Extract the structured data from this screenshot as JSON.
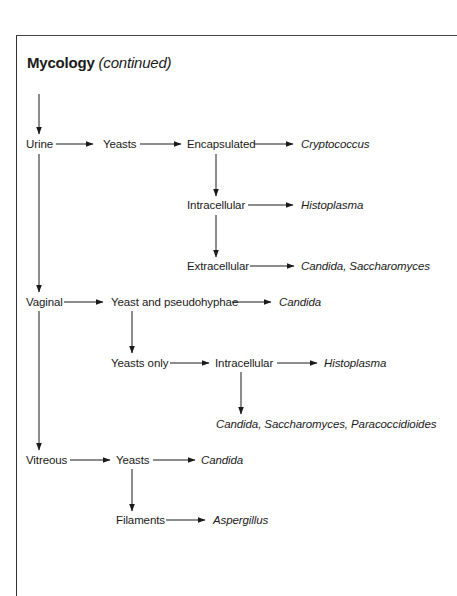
{
  "title": {
    "main": "Mycology",
    "sub": "(continued)"
  },
  "nodes": {
    "urine": "Urine",
    "urine_yeasts": "Yeasts",
    "encapsulated": "Encapsulated",
    "cryptococcus": "Cryptococcus",
    "intracellular_1": "Intracellular",
    "histoplasma_1": "Histoplasma",
    "extracellular": "Extracellular",
    "candida_saccharomyces": "Candida, Saccharomyces",
    "vaginal": "Vaginal",
    "yeast_pseudohyphae": "Yeast and pseudohyphae",
    "candida_1": "Candida",
    "yeasts_only": "Yeasts only",
    "intracellular_2": "Intracellular",
    "histoplasma_2": "Histoplasma",
    "candida_saccharomyces_paracoccidioides": "Candida, Saccharomyces, Paracoccidioides",
    "vitreous": "Vitreous",
    "vitreous_yeasts": "Yeasts",
    "candida_2": "Candida",
    "filaments": "Filaments",
    "aspergillus": "Aspergillus"
  },
  "edges": [
    [
      "(continued)",
      "Urine"
    ],
    [
      "Urine",
      "Yeasts"
    ],
    [
      "Yeasts",
      "Encapsulated"
    ],
    [
      "Encapsulated",
      "Cryptococcus"
    ],
    [
      "Encapsulated",
      "Intracellular"
    ],
    [
      "Intracellular",
      "Histoplasma"
    ],
    [
      "Intracellular",
      "Extracellular"
    ],
    [
      "Extracellular",
      "Candida, Saccharomyces"
    ],
    [
      "Urine",
      "Vaginal"
    ],
    [
      "Vaginal",
      "Yeast and pseudohyphae"
    ],
    [
      "Yeast and pseudohyphae",
      "Candida"
    ],
    [
      "Yeast and pseudohyphae",
      "Yeasts only"
    ],
    [
      "Yeasts only",
      "Intracellular"
    ],
    [
      "Intracellular",
      "Histoplasma"
    ],
    [
      "Intracellular",
      "Candida, Saccharomyces, Paracoccidioides"
    ],
    [
      "Vaginal",
      "Vitreous"
    ],
    [
      "Vitreous",
      "Yeasts"
    ],
    [
      "Yeasts",
      "Candida"
    ],
    [
      "Yeasts",
      "Filaments"
    ],
    [
      "Filaments",
      "Aspergillus"
    ]
  ],
  "colors": {
    "ink": "#1a1a1a",
    "border": "#333333",
    "background": "#ffffff"
  }
}
